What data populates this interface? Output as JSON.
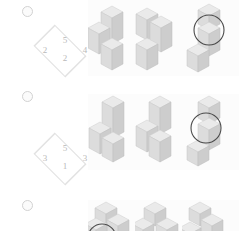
{
  "page": {
    "background_color": "#ffffff",
    "panel_color": "#fcfcfc",
    "marker_icon": "circle-marker-icon"
  },
  "palette": {
    "cube_top": "#eaeaea",
    "cube_left": "#dcdcdc",
    "cube_right": "#cdcdcd",
    "cube_outline": "#c6c6c6",
    "diamond_outline": "#e2e2e2",
    "number_text": "#b9b9b9",
    "annotation_circle": "#4a4a4a"
  },
  "rows": [
    {
      "id": "row-1",
      "marker": "circle-marker-icon",
      "diamond": {
        "top": "5",
        "left": "2",
        "right": "4",
        "bottom": "2"
      },
      "figures": [
        {
          "id": "figure-1-a",
          "annotated": false
        },
        {
          "id": "figure-1-b",
          "annotated": false
        },
        {
          "id": "figure-1-c",
          "annotated": true
        }
      ]
    },
    {
      "id": "row-2",
      "marker": "circle-marker-icon",
      "diamond": {
        "top": "5",
        "left": "3",
        "right": "3",
        "bottom": "1"
      },
      "figures": [
        {
          "id": "figure-2-a",
          "annotated": false
        },
        {
          "id": "figure-2-b",
          "annotated": false
        },
        {
          "id": "figure-2-c",
          "annotated": true
        }
      ]
    },
    {
      "id": "row-3",
      "marker": "circle-marker-icon",
      "diamond": {
        "top": "",
        "left": "",
        "right": "",
        "bottom": ""
      },
      "figures": [
        {
          "id": "figure-3-a",
          "annotated": true
        },
        {
          "id": "figure-3-b",
          "annotated": false
        },
        {
          "id": "figure-3-c",
          "annotated": false
        }
      ]
    }
  ]
}
